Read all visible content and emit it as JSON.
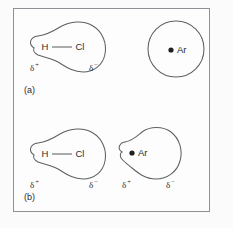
{
  "figure": {
    "frame": {
      "border_color": "#8e9195",
      "background_color": "#fdfdfd"
    },
    "outline_color": "#5d6064",
    "text_color": "#2a2c2f",
    "dot_color": "#1d1f21"
  },
  "panels": [
    {
      "id": "a",
      "label": "(a)",
      "species": [
        {
          "id": "hcl-a",
          "name": "hydrogen-chloride-molecule",
          "shape": "pear",
          "atoms": [
            {
              "symbol": "H",
              "position": "left"
            },
            {
              "symbol": "Cl",
              "position": "right"
            }
          ],
          "bond": "single",
          "charges": [
            {
              "symbol": "δ",
              "sign": "+",
              "position": "left"
            },
            {
              "symbol": "δ",
              "sign": "−",
              "position": "right"
            }
          ]
        },
        {
          "id": "ar-a",
          "name": "argon-atom",
          "shape": "sphere",
          "atoms": [
            {
              "symbol": "Ar",
              "position": "center"
            }
          ],
          "bond": "none",
          "charges": []
        }
      ]
    },
    {
      "id": "b",
      "label": "(b)",
      "species": [
        {
          "id": "hcl-b",
          "name": "hydrogen-chloride-molecule",
          "shape": "pear",
          "atoms": [
            {
              "symbol": "H",
              "position": "left"
            },
            {
              "symbol": "Cl",
              "position": "right"
            }
          ],
          "bond": "single",
          "charges": [
            {
              "symbol": "δ",
              "sign": "+",
              "position": "left"
            },
            {
              "symbol": "δ",
              "sign": "−",
              "position": "right"
            }
          ]
        },
        {
          "id": "ar-b",
          "name": "argon-atom-polarized",
          "shape": "pear",
          "atoms": [
            {
              "symbol": "Ar",
              "position": "left"
            }
          ],
          "bond": "none",
          "charges": [
            {
              "symbol": "δ",
              "sign": "+",
              "position": "left"
            },
            {
              "symbol": "δ",
              "sign": "−",
              "position": "right"
            }
          ]
        }
      ]
    }
  ]
}
